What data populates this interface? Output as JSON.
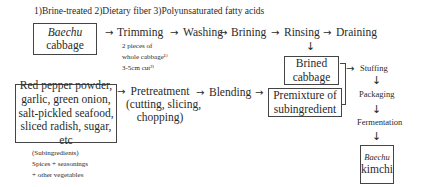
{
  "header": {
    "title": "1)Brine-treated 2)Dietary fiber 3)Polyunsaturated fatty acids"
  },
  "nodes": {
    "baechu_cabbage": {
      "line1": "Baechu",
      "line2": "cabbage"
    },
    "trimming": "Trimming",
    "trimming_notes": [
      "2 pieces of",
      "whole cabbage¹⁾",
      "3-5cm cut²⁾"
    ],
    "washing": "Washing",
    "brining": "Brining",
    "rinsing": "Rinsing",
    "draining": "Draining",
    "brined_cabbage": {
      "line1": "Brined",
      "line2": "cabbage"
    },
    "subingredients_box": {
      "lines": [
        "Red pepper powder,",
        "garlic, green onion,",
        "salt-pickled seafood,",
        "sliced radish, sugar, etc"
      ]
    },
    "pretreatment": {
      "line1": "Pretreatment",
      "line2": "(cutting, slicing,",
      "line3": "chopping)"
    },
    "blending": "Blending",
    "premixture": {
      "line1": "Premixture of",
      "line2": "subingredient"
    },
    "stuffing": "Stuffing",
    "packaging": "Packaging",
    "fermentation": "Fermentation",
    "baechu_kimchi": {
      "line1": "Baechu",
      "line2": "kimchi"
    },
    "subingredients_note": [
      "(Subingredients)",
      "Spices + seasonings",
      "+ other vegetables"
    ]
  },
  "icons": {
    "right_arrow": "→",
    "down_arrow": "↓"
  }
}
